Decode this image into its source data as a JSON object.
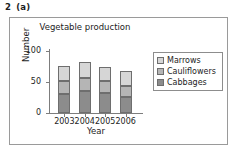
{
  "question": {
    "number": "2",
    "part": "(a)"
  },
  "chart_data": {
    "type": "bar",
    "subtype": "stacked-bar",
    "title": "Vegetable production",
    "xlabel": "Year",
    "ylabel": "Number",
    "categories": [
      "2003",
      "2004",
      "2005",
      "2006"
    ],
    "series": [
      {
        "name": "Cabbages",
        "values": [
          30,
          36,
          32,
          26
        ],
        "color": "#8c8c8c"
      },
      {
        "name": "Cauliflowers",
        "values": [
          22,
          20,
          20,
          17
        ],
        "color": "#b5b5b5"
      },
      {
        "name": "Marrows",
        "values": [
          24,
          27,
          23,
          25
        ],
        "color": "#d6d6d6"
      }
    ],
    "stack_totals": [
      76,
      83,
      75,
      68
    ],
    "ylim": [
      0,
      100
    ],
    "yticks": [
      0,
      50,
      100
    ],
    "ytick_labels": [
      "0",
      "50",
      "100"
    ],
    "grid": false,
    "legend_position": "right",
    "legend_order": [
      "Marrows",
      "Cauliflowers",
      "Cabbages"
    ]
  },
  "legend": {
    "items": [
      {
        "label": "Marrows",
        "color": "#d6d6d6"
      },
      {
        "label": "Cauliflowers",
        "color": "#b5b5b5"
      },
      {
        "label": "Cabbages",
        "color": "#8c8c8c"
      }
    ]
  }
}
